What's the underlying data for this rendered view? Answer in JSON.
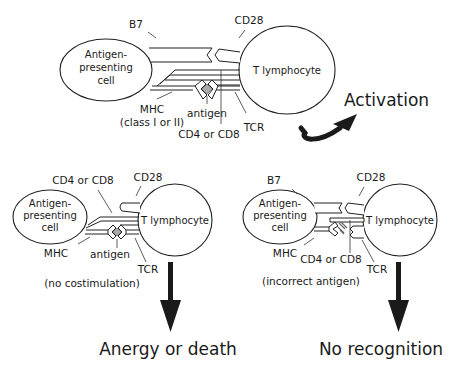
{
  "top_panel": {
    "apc_label": [
      "Antigen-",
      "presenting",
      "cell"
    ],
    "t_cell_label": "T lymphocyte",
    "labels": {
      "b7": "B7",
      "cd28": "CD28",
      "mhc": "MHC",
      "mhc_class": "(class I or II)",
      "antigen": "antigen",
      "cd4_cd8": "CD4 or CD8",
      "tcr": "TCR"
    },
    "outcome": "Activation",
    "arrow_icon": "curved-arrow"
  },
  "bottom_left_panel": {
    "apc_label": [
      "Antigen-",
      "presenting",
      "cell"
    ],
    "t_cell_label": "T lymphocyte",
    "labels": {
      "cd4_cd8": "CD4 or CD8",
      "cd28": "CD28",
      "mhc": "MHC",
      "antigen": "antigen",
      "tcr": "TCR"
    },
    "condition": "(no costimulation)",
    "outcome": "Anergy or death",
    "arrow_icon": "down-arrow"
  },
  "bottom_right_panel": {
    "apc_label": [
      "Antigen-",
      "presenting",
      "cell"
    ],
    "t_cell_label": "T lymphocyte",
    "labels": {
      "b7": "B7",
      "cd28": "CD28",
      "mhc": "MHC",
      "cd4_cd8": "CD4 or CD8",
      "tcr": "TCR"
    },
    "condition": "(incorrect antigen)",
    "outcome": "No recognition",
    "arrow_icon": "down-arrow"
  },
  "colors": {
    "ink": "#1a1a1a",
    "antigen_fill": "#aaaaaa",
    "background": "#ffffff"
  }
}
